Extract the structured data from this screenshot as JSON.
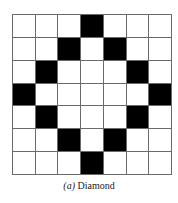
{
  "figure": {
    "rows": 7,
    "cols": 7,
    "filled_color": "#000000",
    "empty_color": "#ffffff",
    "grid_line_color": "#6a6a6a",
    "pattern": [
      [
        0,
        0,
        0,
        1,
        0,
        0,
        0
      ],
      [
        0,
        0,
        1,
        0,
        1,
        0,
        0
      ],
      [
        0,
        1,
        0,
        0,
        0,
        1,
        0
      ],
      [
        1,
        0,
        0,
        0,
        0,
        0,
        1
      ],
      [
        0,
        1,
        0,
        0,
        0,
        1,
        0
      ],
      [
        0,
        0,
        1,
        0,
        1,
        0,
        0
      ],
      [
        0,
        0,
        0,
        1,
        0,
        0,
        0
      ]
    ],
    "caption": {
      "label": "(a)",
      "text": "Diamond"
    }
  }
}
